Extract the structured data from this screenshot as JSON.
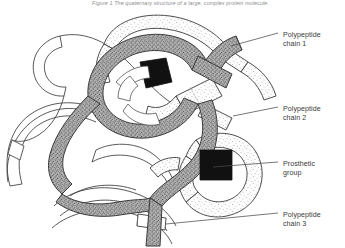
{
  "figure": {
    "top_caption": "Figure 1  The quaternary structure of a large, complex protein molecule.",
    "alt": "Diagram of three intertwined polypeptide chains forming a protein quaternary structure with two prosthetic groups"
  },
  "labels": [
    {
      "id": "chain1",
      "name": "label-polypeptide-chain-1",
      "line1": "Polypeptide",
      "line2": "chain 1",
      "leader": {
        "x1": 231,
        "y1": 46,
        "x2": 278,
        "y2": 33
      }
    },
    {
      "id": "chain2",
      "name": "label-polypeptide-chain-2",
      "line1": "Polypeptide",
      "line2": "chain 2",
      "leader": {
        "x1": 233,
        "y1": 116,
        "x2": 278,
        "y2": 107
      }
    },
    {
      "id": "prosthetic",
      "name": "label-prosthetic-group",
      "line1": "Prosthetic",
      "line2": "group",
      "leader": {
        "x1": 213,
        "y1": 167,
        "x2": 278,
        "y2": 162
      }
    },
    {
      "id": "chain3",
      "name": "label-polypeptide-chain-3",
      "line1": "Polypeptide",
      "line2": "chain 3",
      "leader": {
        "x1": 166,
        "y1": 224,
        "x2": 278,
        "y2": 213
      }
    }
  ],
  "colors": {
    "background": "#ffffff",
    "outline": "#3b3b3b",
    "chain_dark_fill": "#a8a8a8",
    "chain_light_fill": "#fbfbfb",
    "chain_plain_fill": "#ffffff",
    "prosthetic_fill": "#111111",
    "leader_line": "#4a4a4a",
    "caption_text": "#8e8e8e",
    "label_text": "#3a3a3a"
  },
  "elements": {
    "chain1_name": "polypeptide-chain-1-tube",
    "chain2_name": "polypeptide-chain-2-tube",
    "chain3_name": "polypeptide-chain-3-tube",
    "backbone_name": "central-dark-chain-tube",
    "prosthetic_upper_name": "prosthetic-group-upper",
    "prosthetic_lower_name": "prosthetic-group-lower"
  }
}
